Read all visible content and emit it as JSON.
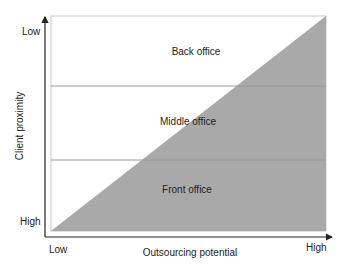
{
  "diagram": {
    "type": "outsourcing-matrix",
    "x_axis": {
      "title": "Outsourcing potential",
      "low_label": "Low",
      "high_label": "High"
    },
    "y_axis": {
      "title": "Client proximity",
      "top_label": "Low",
      "bottom_label": "High"
    },
    "regions": [
      {
        "label": "Back office"
      },
      {
        "label": "Middle office"
      },
      {
        "label": "Front office"
      }
    ],
    "colors": {
      "shaded_triangle": "#a9a9a9",
      "box_border": "#c8c8c8",
      "divider": "#9a9a9a",
      "axis": "#222222",
      "background": "#ffffff"
    }
  }
}
